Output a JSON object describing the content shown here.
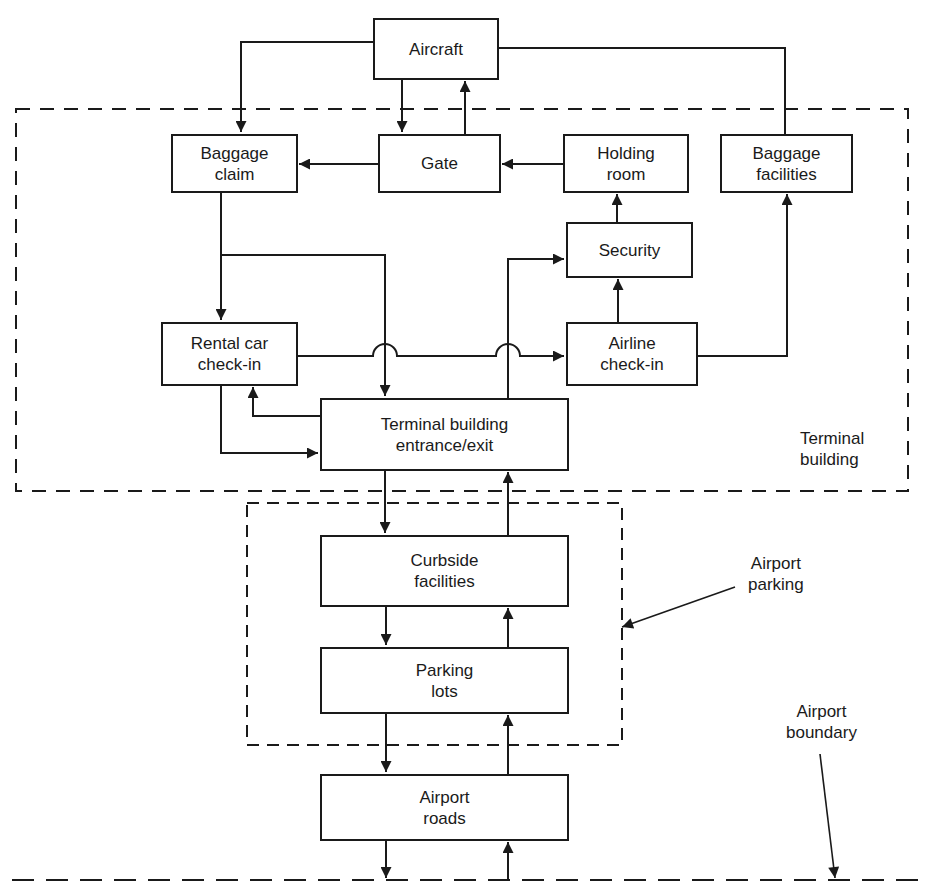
{
  "diagram": {
    "nodes": {
      "aircraft": {
        "lines": [
          "Aircraft"
        ]
      },
      "gate": {
        "lines": [
          "Gate"
        ]
      },
      "baggage_claim": {
        "lines": [
          "Baggage",
          "claim"
        ]
      },
      "holding_room": {
        "lines": [
          "Holding",
          "room"
        ]
      },
      "baggage_facilities": {
        "lines": [
          "Baggage",
          "facilities"
        ]
      },
      "security": {
        "lines": [
          "Security"
        ]
      },
      "rental_car_checkin": {
        "lines": [
          "Rental car",
          "check-in"
        ]
      },
      "airline_checkin": {
        "lines": [
          "Airline",
          "check-in"
        ]
      },
      "terminal_entrance": {
        "lines": [
          "Terminal building",
          "entrance/exit"
        ]
      },
      "curbside": {
        "lines": [
          "Curbside",
          "facilities"
        ]
      },
      "parking_lots": {
        "lines": [
          "Parking",
          "lots"
        ]
      },
      "airport_roads": {
        "lines": [
          "Airport",
          "roads"
        ]
      }
    },
    "regions": {
      "terminal_building": {
        "lines": [
          "Terminal",
          "building"
        ]
      },
      "airport_parking": {
        "lines": [
          "Airport",
          "parking"
        ]
      },
      "airport_boundary": {
        "lines": [
          "Airport",
          "boundary"
        ]
      }
    },
    "edges": [
      {
        "from": "Aircraft",
        "to": "Baggage claim"
      },
      {
        "from": "Aircraft",
        "to": "Gate"
      },
      {
        "from": "Gate",
        "to": "Aircraft"
      },
      {
        "from": "Aircraft",
        "to": "Baggage facilities",
        "arrow": false
      },
      {
        "from": "Gate",
        "to": "Baggage claim"
      },
      {
        "from": "Holding room",
        "to": "Gate"
      },
      {
        "from": "Security",
        "to": "Holding room"
      },
      {
        "from": "Airline check-in",
        "to": "Security"
      },
      {
        "from": "Airline check-in",
        "to": "Baggage facilities"
      },
      {
        "from": "Baggage claim",
        "to": "Rental car check-in"
      },
      {
        "from": "Baggage claim",
        "to": "Terminal building entrance/exit"
      },
      {
        "from": "Rental car check-in",
        "to": "Airline check-in"
      },
      {
        "from": "Rental car check-in",
        "to": "Terminal building entrance/exit"
      },
      {
        "from": "Terminal building entrance/exit",
        "to": "Rental car check-in"
      },
      {
        "from": "Terminal building entrance/exit",
        "to": "Security"
      },
      {
        "from": "Terminal building entrance/exit",
        "to": "Curbside facilities"
      },
      {
        "from": "Curbside facilities",
        "to": "Terminal building entrance/exit"
      },
      {
        "from": "Curbside facilities",
        "to": "Parking lots"
      },
      {
        "from": "Parking lots",
        "to": "Curbside facilities"
      },
      {
        "from": "Parking lots",
        "to": "Airport roads"
      },
      {
        "from": "Airport roads",
        "to": "Parking lots"
      },
      {
        "from": "Airport roads",
        "to": "Airport boundary"
      },
      {
        "from": "Airport boundary",
        "to": "Airport roads"
      }
    ],
    "colors": {
      "ink": "#1a1a1a",
      "background": "#ffffff"
    }
  }
}
